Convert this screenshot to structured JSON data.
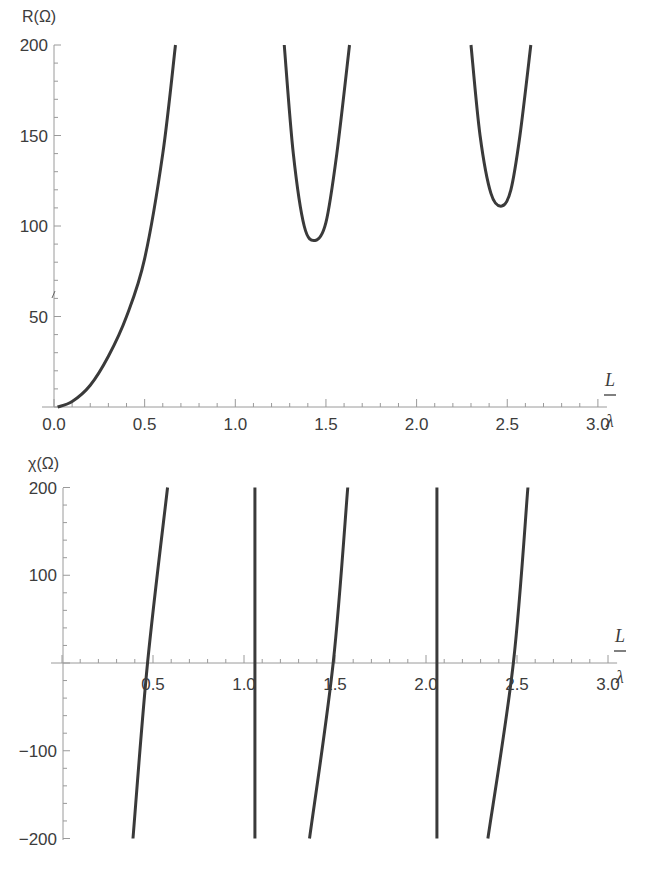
{
  "chart_data": [
    {
      "type": "line",
      "title": "",
      "ylabel": "R(Ω)",
      "xlabel_num": "L",
      "xlabel_den": "λ",
      "xlim": [
        0,
        3.0
      ],
      "ylim": [
        0,
        200
      ],
      "x_ticks": [
        "0.0",
        "0.5",
        "1.0",
        "1.5",
        "2.0",
        "2.5",
        "3.0"
      ],
      "y_ticks": [
        "50",
        "100",
        "150",
        "200"
      ],
      "grid": false,
      "legend": null,
      "series": [
        {
          "name": "R branch 1",
          "x": [
            0.02,
            0.1,
            0.2,
            0.3,
            0.4,
            0.5,
            0.6,
            0.67
          ],
          "y": [
            0,
            3,
            12,
            28,
            50,
            82,
            140,
            200
          ]
        },
        {
          "name": "R branch 2",
          "x": [
            1.27,
            1.32,
            1.38,
            1.44,
            1.5,
            1.56,
            1.63
          ],
          "y": [
            200,
            140,
            100,
            92,
            102,
            140,
            200
          ]
        },
        {
          "name": "R branch 3",
          "x": [
            2.3,
            2.35,
            2.41,
            2.47,
            2.52,
            2.57,
            2.63
          ],
          "y": [
            200,
            150,
            118,
            111,
            120,
            150,
            200
          ]
        }
      ],
      "annotations": {
        "min_branch2": {
          "x": 1.44,
          "y": 92
        },
        "min_branch3": {
          "x": 2.47,
          "y": 111
        }
      }
    },
    {
      "type": "line",
      "title": "",
      "ylabel": "χ(Ω)",
      "xlabel_num": "L",
      "xlabel_den": "λ",
      "xlim": [
        0,
        3.0
      ],
      "ylim": [
        -200,
        200
      ],
      "x_ticks": [
        "0.5",
        "1.0",
        "1.5",
        "2.0",
        "2.5",
        "3.0"
      ],
      "y_ticks": [
        "-200",
        "-100",
        "100",
        "200"
      ],
      "grid": false,
      "legend": null,
      "series": [
        {
          "name": "X branch 1",
          "x": [
            0.39,
            0.47,
            0.58
          ],
          "y": [
            -200,
            0,
            200
          ]
        },
        {
          "name": "X branch 2",
          "x": [
            1.06,
            1.06,
            1.06
          ],
          "y": [
            -200,
            0,
            200
          ]
        },
        {
          "name": "X branch 3",
          "x": [
            1.36,
            1.49,
            1.57
          ],
          "y": [
            -200,
            0,
            200
          ]
        },
        {
          "name": "X branch 4",
          "x": [
            2.06,
            2.06,
            2.06
          ],
          "y": [
            -200,
            0,
            200
          ]
        },
        {
          "name": "X branch 5",
          "x": [
            2.34,
            2.48,
            2.56
          ],
          "y": [
            -200,
            0,
            200
          ]
        }
      ]
    }
  ]
}
